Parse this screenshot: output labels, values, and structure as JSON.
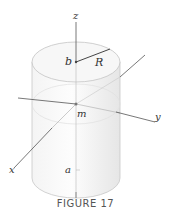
{
  "figure": {
    "caption": "FIGURE 17",
    "labels": {
      "z": "z",
      "b": "b",
      "R": "R",
      "m": "m",
      "y": "y",
      "x": "x",
      "a": "a"
    }
  }
}
